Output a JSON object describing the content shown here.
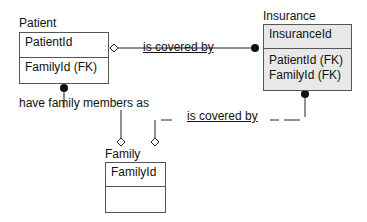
{
  "entities": {
    "patient": {
      "title": "Patient",
      "key": "PatientId",
      "attributes": [
        "FamilyId (FK)"
      ]
    },
    "insurance": {
      "title": "Insurance",
      "key": "InsuranceId",
      "attributes": [
        "PatientId (FK)",
        "FamilyId (FK)"
      ],
      "fill": "#e8e8e8"
    },
    "family": {
      "title": "Family",
      "key": "FamilyId",
      "attributes": []
    }
  },
  "relationships": [
    {
      "label": "is covered by",
      "from": "Patient",
      "to": "Insurance"
    },
    {
      "label": "have family members as",
      "from": "Patient",
      "to": "Family"
    },
    {
      "label": "is covered by",
      "from": "Family",
      "to": "Insurance"
    }
  ]
}
